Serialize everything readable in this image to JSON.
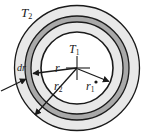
{
  "figure": {
    "center": {
      "x": 77,
      "y": 68
    },
    "rings": [
      {
        "name": "outer-shell",
        "radius_px": 63,
        "fill": "#e8e8e8",
        "stroke": "#1a1a1a"
      },
      {
        "name": "dark-band-outer",
        "radius_px": 52,
        "fill": "#a8a8a8",
        "stroke": "#1a1a1a"
      },
      {
        "name": "dark-band-inner",
        "radius_px": 46,
        "fill": "#e8e8e8",
        "stroke": "#1a1a1a"
      },
      {
        "name": "inner-core",
        "radius_px": 36,
        "fill": "#ffffff",
        "stroke": "#1a1a1a"
      }
    ],
    "colors": {
      "shell_fill": "#e8e8e8",
      "band_fill": "#a8a8a8",
      "core_fill": "#ffffff",
      "stroke": "#1a1a1a",
      "background": "#ffffff"
    }
  },
  "labels": {
    "T2": {
      "text": "T",
      "sub": "2"
    },
    "T1": {
      "text": "T",
      "sub": "1"
    },
    "r": {
      "text": "r",
      "sub": ""
    },
    "r2": {
      "text": "r",
      "sub": "2"
    },
    "r1": {
      "text": "r",
      "sub": "1"
    },
    "dr": {
      "text": "dr",
      "sub": ""
    }
  },
  "arrows": [
    {
      "name": "arrow-r",
      "from": {
        "x": 77,
        "y": 68
      },
      "to": {
        "x": 32,
        "y": 73
      },
      "label": "r"
    },
    {
      "name": "arrow-r2",
      "from": {
        "x": 77,
        "y": 68
      },
      "to": {
        "x": 34,
        "y": 116
      },
      "label": "r2"
    },
    {
      "name": "arrow-r1",
      "from": {
        "x": 77,
        "y": 68
      },
      "to": {
        "x": 110,
        "y": 82
      },
      "label": "r1"
    },
    {
      "name": "arrow-dr",
      "from": {
        "x": 2,
        "y": 90
      },
      "to": {
        "x": 26,
        "y": 79
      },
      "label": "dr"
    }
  ]
}
